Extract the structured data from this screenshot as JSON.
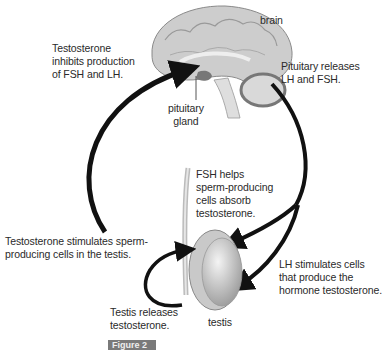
{
  "labels": {
    "brain": "brain",
    "pituitary_gland": "pituitary\ngland",
    "testosterone_inhibits": "Testosterone\ninhibits production\nof FSH and LH.",
    "pituitary_releases": "Pituitary releases\nLH and FSH.",
    "fsh_helps": "FSH helps\nsperm-producing\ncells absorb\ntestosterone.",
    "testosterone_stimulates": "Testosterone stimulates sperm-\nproducing cells in the testis.",
    "lh_stimulates": "LH stimulates cells\nthat produce the\nhormone testosterone.",
    "testis_releases": "Testis releases\ntestosterone.",
    "testis": "testis",
    "figure_tag": "Figure 2"
  },
  "colors": {
    "arrow": "#111111",
    "brain_fill": "#cfcfcf",
    "testis_fill": "#d8d8d8",
    "text": "#2a2a2a"
  }
}
